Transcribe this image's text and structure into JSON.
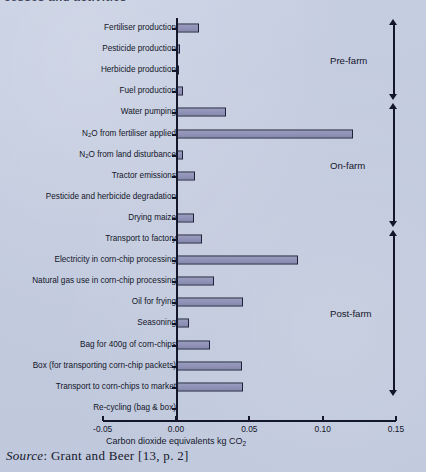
{
  "page": {
    "clipped_heading": "cesses and activities",
    "source_prefix": "Source",
    "source_text": ": Grant and Beer [13, p. 2]"
  },
  "chart_data": {
    "type": "bar",
    "orientation": "horizontal",
    "title": "",
    "xlabel": "Carbon dioxide equivalents kg CO₂",
    "xlabel_main": "Carbon dioxide equivalents kg CO",
    "xlabel_sub": "2",
    "ylabel": "",
    "xlim": [
      -0.05,
      0.15
    ],
    "grid": false,
    "legend": "none",
    "tick_values": [
      -0.05,
      0.0,
      0.05,
      0.1,
      0.15
    ],
    "tick_labels": [
      "-0.05",
      "0.00",
      "0.05",
      "0.10",
      "0.15"
    ],
    "bar_color": "#8f92b6",
    "bar_edge_color": "#1d2038",
    "axis_color": "#14162a",
    "background_color": "#c3cbdf",
    "categories": [
      "Fertiliser production",
      "Pesticide production",
      "Herbicide production",
      "Fuel production",
      "Water pumping",
      "N₂O from fertiliser applied",
      "N₂O from land disturbance",
      "Tractor emissions",
      "Pesticide and herbicide degradation",
      "Drying maize",
      "Transport to factory",
      "Electricity in corn-chip processing",
      "Natural gas use in corn-chip processing",
      "Oil for frying",
      "Seasoning",
      "Bag for 400g of corn-chips",
      "Box (for transporting corn-chip packets)",
      "Transport to corn-chips to market",
      "Re-cycling (bag & box)"
    ],
    "values": [
      0.016,
      0.003,
      0.002,
      0.005,
      0.034,
      0.121,
      0.005,
      0.013,
      0.0,
      0.012,
      0.018,
      0.083,
      0.026,
      0.046,
      0.009,
      0.023,
      0.045,
      0.046,
      0.0
    ],
    "rows": [
      {
        "label_main": "Fertiliser production",
        "label_sub": "",
        "label_tail": "",
        "value": 0.016,
        "group": "Pre-farm"
      },
      {
        "label_main": "Pesticide production",
        "label_sub": "",
        "label_tail": "",
        "value": 0.003,
        "group": "Pre-farm"
      },
      {
        "label_main": "Herbicide production",
        "label_sub": "",
        "label_tail": "",
        "value": 0.002,
        "group": "Pre-farm"
      },
      {
        "label_main": "Fuel production",
        "label_sub": "",
        "label_tail": "",
        "value": 0.005,
        "group": "Pre-farm"
      },
      {
        "label_main": "Water pumping",
        "label_sub": "",
        "label_tail": "",
        "value": 0.034,
        "group": "On-farm"
      },
      {
        "label_main": "N",
        "label_sub": "2",
        "label_tail": "O from fertiliser applied",
        "value": 0.121,
        "group": "On-farm"
      },
      {
        "label_main": "N",
        "label_sub": "2",
        "label_tail": "O from land disturbance",
        "value": 0.005,
        "group": "On-farm"
      },
      {
        "label_main": "Tractor emissions",
        "label_sub": "",
        "label_tail": "",
        "value": 0.013,
        "group": "On-farm"
      },
      {
        "label_main": "Pesticide and herbicide degradation",
        "label_sub": "",
        "label_tail": "",
        "value": 0.0,
        "group": "On-farm"
      },
      {
        "label_main": "Drying maize",
        "label_sub": "",
        "label_tail": "",
        "value": 0.012,
        "group": "On-farm"
      },
      {
        "label_main": "Transport to factory",
        "label_sub": "",
        "label_tail": "",
        "value": 0.018,
        "group": "Post-farm"
      },
      {
        "label_main": "Electricity in corn-chip processing",
        "label_sub": "",
        "label_tail": "",
        "value": 0.083,
        "group": "Post-farm"
      },
      {
        "label_main": "Natural gas use in corn-chip processing",
        "label_sub": "",
        "label_tail": "",
        "value": 0.026,
        "group": "Post-farm"
      },
      {
        "label_main": "Oil for frying",
        "label_sub": "",
        "label_tail": "",
        "value": 0.046,
        "group": "Post-farm"
      },
      {
        "label_main": "Seasoning",
        "label_sub": "",
        "label_tail": "",
        "value": 0.009,
        "group": "Post-farm"
      },
      {
        "label_main": "Bag for 400g of corn-chips",
        "label_sub": "",
        "label_tail": "",
        "value": 0.023,
        "group": "Post-farm"
      },
      {
        "label_main": "Box (for transporting corn-chip packets)",
        "label_sub": "",
        "label_tail": "",
        "value": 0.045,
        "group": "Post-farm"
      },
      {
        "label_main": "Transport to corn-chips to market",
        "label_sub": "",
        "label_tail": "",
        "value": 0.046,
        "group": "Post-farm"
      },
      {
        "label_main": "Re-cycling (bag & box)",
        "label_sub": "",
        "label_tail": "",
        "value": 0.0,
        "group": "Post-farm"
      }
    ],
    "groups": [
      {
        "name": "Pre-farm",
        "first_row": 0,
        "last_row": 3
      },
      {
        "name": "On-farm",
        "first_row": 4,
        "last_row": 9
      },
      {
        "name": "Post-farm",
        "first_row": 10,
        "last_row": 17
      }
    ],
    "annotations": [
      {
        "text": "Pre-farm",
        "kind": "group-bracket"
      },
      {
        "text": "On-farm",
        "kind": "group-bracket"
      },
      {
        "text": "Post-farm",
        "kind": "group-bracket"
      }
    ]
  }
}
